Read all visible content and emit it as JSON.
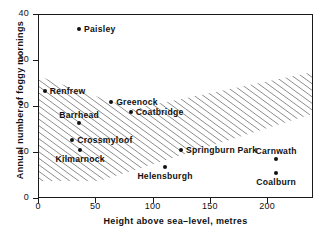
{
  "chart_data": {
    "type": "scatter",
    "title": "",
    "xlabel": "Height above sea–level, metres",
    "ylabel": "Annual number of foggy mornings",
    "xlim": [
      0,
      240
    ],
    "ylim": [
      0,
      40
    ],
    "xticks": [
      0,
      50,
      100,
      150,
      200
    ],
    "xticklabels": [
      "0",
      "50",
      "100",
      "150",
      "200"
    ],
    "yticks": [
      0,
      10,
      20,
      30,
      40
    ],
    "yticklabels": [
      "0",
      "10",
      "20",
      "30",
      "40"
    ],
    "grid": false,
    "legend": "none",
    "point_color": "#111111",
    "axis_color": "#1a1a1a",
    "annotation": "Hatched band of parallel diagonal lines sweeps from upper-left to lower-right indicating the declining trend",
    "points": [
      {
        "label": "Paisley",
        "x": 35,
        "y": 37,
        "label_pos": "right"
      },
      {
        "label": "Renfrew",
        "x": 5,
        "y": 23.5,
        "label_pos": "right"
      },
      {
        "label": "Greenock",
        "x": 63,
        "y": 21,
        "label_pos": "right"
      },
      {
        "label": "Coatbridge",
        "x": 80,
        "y": 19,
        "label_pos": "right"
      },
      {
        "label": "Barrhead",
        "x": 35,
        "y": 16.5,
        "label_pos": "above"
      },
      {
        "label": "Crossmyloof",
        "x": 29,
        "y": 12.8,
        "label_pos": "right"
      },
      {
        "label": "Kilmarnock",
        "x": 36,
        "y": 10.6,
        "label_pos": "below"
      },
      {
        "label": "Springburn Park",
        "x": 124,
        "y": 10.6,
        "label_pos": "right"
      },
      {
        "label": "Carnwath",
        "x": 207,
        "y": 8.7,
        "label_pos": "above"
      },
      {
        "label": "Helensburgh",
        "x": 110,
        "y": 7.0,
        "label_pos": "below"
      },
      {
        "label": "Coalburn",
        "x": 207,
        "y": 5.6,
        "label_pos": "below"
      }
    ]
  }
}
